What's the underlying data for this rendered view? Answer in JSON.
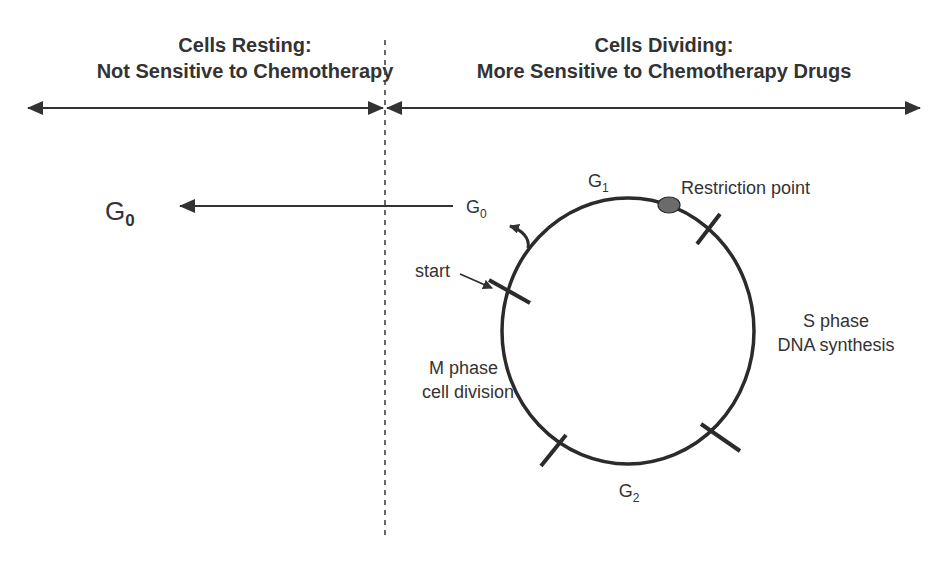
{
  "header": {
    "left": {
      "line1": "Cells Resting:",
      "line2": "Not Sensitive to Chemotherapy"
    },
    "right": {
      "line1": "Cells Dividing:",
      "line2": "More Sensitive to Chemotherapy Drugs"
    }
  },
  "resting": {
    "g0_main": "G",
    "g0_main_sub": "0"
  },
  "cycle": {
    "g0_exit": "G",
    "g0_exit_sub": "0",
    "g1": "G",
    "g1_sub": "1",
    "g2": "G",
    "g2_sub": "2",
    "restriction_point": "Restriction point",
    "start": "start",
    "s_phase_line1": "S phase",
    "s_phase_line2": "DNA synthesis",
    "m_phase_line1": "M phase",
    "m_phase_line2": "cell division"
  },
  "colors": {
    "ink": "#333333",
    "restriction_dot": "#6b6b6b",
    "background": "#ffffff"
  }
}
